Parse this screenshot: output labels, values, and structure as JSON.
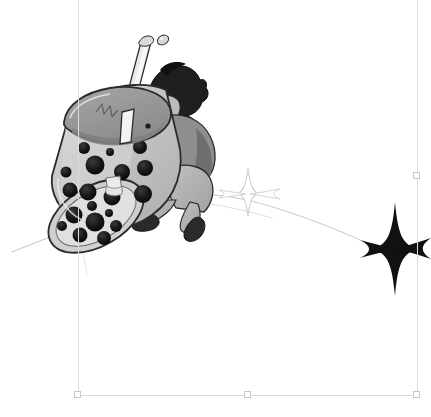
{
  "app": {
    "surface_label": "Illustration canvas",
    "background_color": "#ffffff"
  },
  "selection": {
    "label": "Selected object bounding box",
    "bounds": {
      "left": 78,
      "top": -6,
      "right": 417,
      "bottom": 395
    },
    "guide_color": "#d9dde2",
    "handle_fill": "#ffffff",
    "handle_stroke": "#c2c8cf",
    "handles": [
      {
        "name": "handle-bottom-left",
        "x": 78,
        "y": 395,
        "label": "Bottom left resize handle"
      },
      {
        "name": "handle-bottom-center",
        "x": 248,
        "y": 395,
        "label": "Bottom center resize handle"
      },
      {
        "name": "handle-bottom-right",
        "x": 417,
        "y": 395,
        "label": "Bottom right resize handle"
      },
      {
        "name": "handle-middle-right",
        "x": 417,
        "y": 176,
        "label": "Middle right resize handle"
      }
    ]
  },
  "artwork": {
    "title": "Character carrying a giant boba tea cup",
    "style": "grayscale manga line art",
    "palette": {
      "outline": "#2b2b2b",
      "cup_body": "#b9b9b9",
      "cup_body_light": "#d2d2d2",
      "cup_highlight": "#e8e8e8",
      "lid": "#9a9a9a",
      "lid_shadow": "#8a8a8a",
      "pearl": "#1a1a1a",
      "straw": "#e6e6e6",
      "hair": "#1f1f1f",
      "skin": "#bcbcbc",
      "jacket": "#8e8e8e",
      "jacket_dark": "#6f6f6f",
      "pants": "#b4b4b4",
      "shoe": "#2a2a2a",
      "sparkle_solid": "#111111",
      "sparkle_outline": "#cfcfcf",
      "speed_line": "#c9c9c9"
    },
    "elements": [
      {
        "name": "boba-cup",
        "label": "Giant tilted boba tea cup",
        "pearl_count": 24
      },
      {
        "name": "cup-lid",
        "label": "Dome lid of the boba cup"
      },
      {
        "name": "drinking-straw",
        "label": "Straw with droplet at tip"
      },
      {
        "name": "character-figure",
        "label": "Person with dark hair carrying the cup"
      },
      {
        "name": "sparkle-outline",
        "label": "Small outlined four-point sparkle"
      },
      {
        "name": "sparkle-solid",
        "label": "Large solid black four-point sparkle"
      },
      {
        "name": "motion-trail",
        "label": "Curved motion trail line"
      },
      {
        "name": "speed-line-left",
        "label": "Diagonal speed line toward lower left"
      }
    ]
  }
}
